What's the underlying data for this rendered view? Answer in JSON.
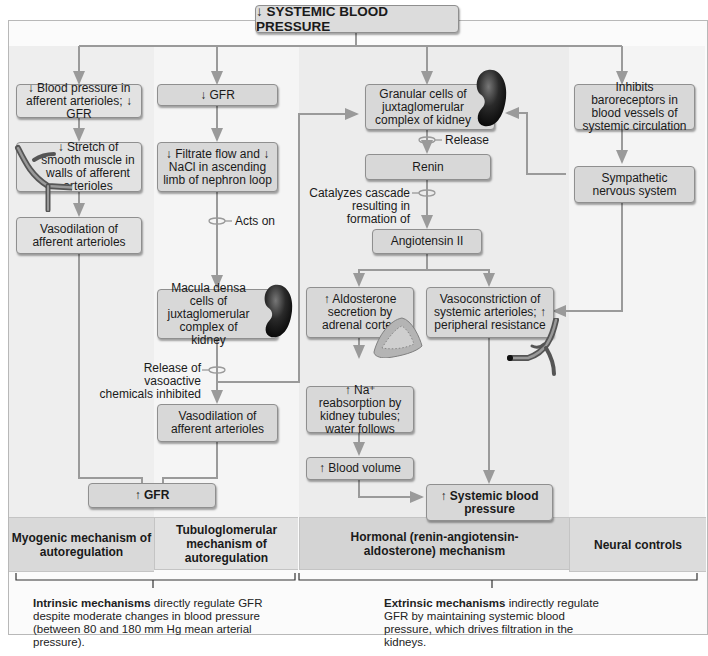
{
  "title": "↓ SYSTEMIC BLOOD PRESSURE",
  "boxes": {
    "bp_afferent": "↓ Blood pressure in afferent arterioles; ↓ GFR",
    "stretch": "↓ Stretch of smooth muscle in walls of afferent arterioles",
    "vasodilation_left": "Vasodilation of afferent arterioles",
    "gfr_down": "↓ GFR",
    "filtrate": "↓ Filtrate flow and ↓ NaCl in ascending limb of nephron loop",
    "macula_densa": "Macula densa cells of juxtaglomerular complex of kidney",
    "vasodilation_mid": "Vasodilation of afferent arterioles",
    "gfr_up": "↑ GFR",
    "granular": "Granular cells of juxtaglomerular complex of kidney",
    "renin": "Renin",
    "angiotensin": "Angiotensin II",
    "aldosterone": "↑ Aldosterone secretion by adrenal cortex",
    "vasoconstriction": "Vasoconstriction of systemic arterioles; ↑ peripheral resistance",
    "na_reabsorption": "↑ Na⁺ reabsorption by kidney tubules; water follows",
    "blood_volume": "↑ Blood volume",
    "systemic_bp_up": "↑ Systemic blood pressure",
    "baroreceptors": "Inhibits baroreceptors in blood vessels of systemic circulation",
    "sympathetic": "Sympathetic nervous system"
  },
  "labels": {
    "acts_on": "Acts on",
    "release": "Release",
    "catalyzes": "Catalyzes cascade resulting in formation of",
    "vasoactive": "Release of vasoactive chemicals inhibited"
  },
  "mechanisms": {
    "myogenic": "Myogenic mechanism of autoregulation",
    "tubuloglomerular": "Tubuloglomerular mechanism of autoregulation",
    "hormonal": "Hormonal (renin-angiotensin-aldosterone) mechanism",
    "neural": "Neural controls"
  },
  "footnotes": {
    "intrinsic_bold": "Intrinsic mechanisms",
    "intrinsic_rest": " directly regulate GFR despite moderate changes in blood pressure (between 80 and 180 mm Hg mean arterial pressure).",
    "extrinsic_bold": "Extrinsic mechanisms",
    "extrinsic_rest": " indirectly regulate GFR by maintaining systemic blood pressure, which drives filtration in the kidneys."
  },
  "illustrations": [
    "kidney-icon",
    "kidney-icon",
    "arteriole-icon",
    "arteriole-icon",
    "adrenal-gland-icon"
  ]
}
